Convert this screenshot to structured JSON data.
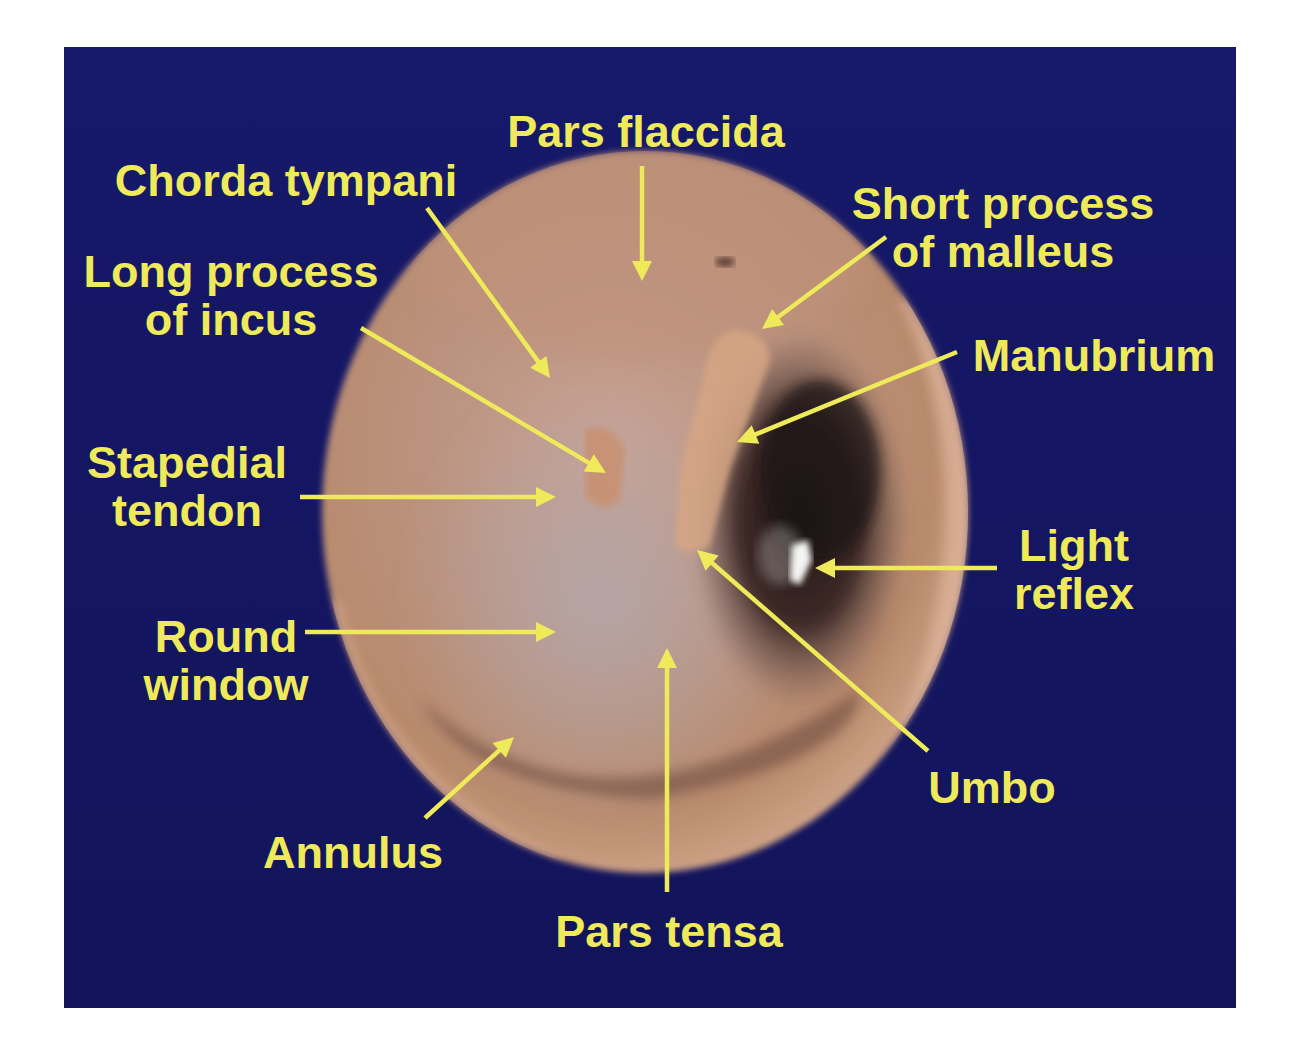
{
  "figure": {
    "colors": {
      "page_background": "#ffffff",
      "panel_background": "#151763",
      "label_color": "#eeea5a",
      "arrow_color": "#eeea5a",
      "membrane_tan": "#b98a6c",
      "canal_rim_pink": "#e2b8a0",
      "cavity_dark": "#2a1b1a",
      "light_reflex_white": "#ffffff"
    },
    "panel": {
      "x": 64,
      "y": 47,
      "width": 1172,
      "height": 961
    },
    "image_circle": {
      "cx": 645,
      "cy": 512,
      "rx": 323,
      "ry": 361
    }
  },
  "labels": [
    {
      "id": "pars-flaccida",
      "lines": [
        "Pars flaccida"
      ],
      "x": 646,
      "y": 147,
      "anchor": "middle"
    },
    {
      "id": "chorda-tympani",
      "lines": [
        "Chorda tympani"
      ],
      "x": 286,
      "y": 196,
      "anchor": "middle"
    },
    {
      "id": "short-process-of-malleus",
      "lines": [
        "Short process",
        "of malleus"
      ],
      "x": 1003,
      "y": 219,
      "anchor": "middle"
    },
    {
      "id": "long-process-of-incus",
      "lines": [
        "Long process",
        "of incus"
      ],
      "x": 231,
      "y": 287,
      "anchor": "middle"
    },
    {
      "id": "manubrium",
      "lines": [
        "Manubrium"
      ],
      "x": 1094,
      "y": 371,
      "anchor": "middle"
    },
    {
      "id": "stapedial-tendon",
      "lines": [
        "Stapedial",
        "tendon"
      ],
      "x": 187,
      "y": 478,
      "anchor": "middle"
    },
    {
      "id": "light-reflex",
      "lines": [
        "Light",
        "reflex"
      ],
      "x": 1074,
      "y": 561,
      "anchor": "middle"
    },
    {
      "id": "round-window",
      "lines": [
        "Round",
        "window"
      ],
      "x": 226,
      "y": 652,
      "anchor": "middle"
    },
    {
      "id": "umbo",
      "lines": [
        "Umbo"
      ],
      "x": 992,
      "y": 803,
      "anchor": "middle"
    },
    {
      "id": "annulus",
      "lines": [
        "Annulus"
      ],
      "x": 353,
      "y": 868,
      "anchor": "middle"
    },
    {
      "id": "pars-tensa",
      "lines": [
        "Pars tensa"
      ],
      "x": 669,
      "y": 947,
      "anchor": "middle"
    }
  ],
  "arrows": [
    {
      "id": "pars-flaccida",
      "from": [
        642,
        166
      ],
      "to": [
        642,
        281
      ]
    },
    {
      "id": "chorda-tympani",
      "from": [
        427,
        208
      ],
      "to": [
        550,
        378
      ]
    },
    {
      "id": "short-process-of-malleus",
      "from": [
        886,
        237
      ],
      "to": [
        762,
        329
      ]
    },
    {
      "id": "long-process-of-incus",
      "from": [
        361,
        328
      ],
      "to": [
        606,
        473
      ]
    },
    {
      "id": "manubrium",
      "from": [
        957,
        352
      ],
      "to": [
        737,
        442
      ]
    },
    {
      "id": "stapedial-tendon",
      "from": [
        300,
        497
      ],
      "to": [
        556,
        497
      ]
    },
    {
      "id": "light-reflex",
      "from": [
        997,
        568
      ],
      "to": [
        815,
        568
      ]
    },
    {
      "id": "round-window",
      "from": [
        305,
        632
      ],
      "to": [
        556,
        632
      ]
    },
    {
      "id": "umbo",
      "from": [
        928,
        751
      ],
      "to": [
        697,
        550
      ]
    },
    {
      "id": "annulus",
      "from": [
        425,
        818
      ],
      "to": [
        514,
        737
      ]
    },
    {
      "id": "pars-tensa",
      "from": [
        667,
        892
      ],
      "to": [
        667,
        648
      ]
    }
  ]
}
